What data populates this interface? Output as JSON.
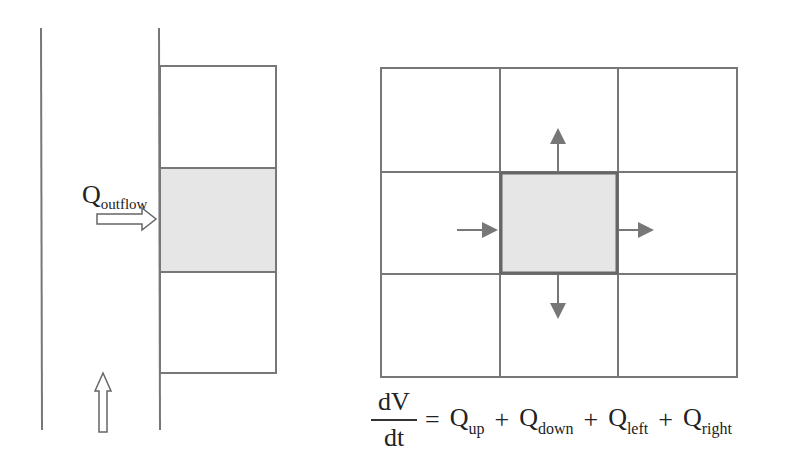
{
  "left_panel": {
    "inflow_label": {
      "main": "Q",
      "sub": "outflow"
    },
    "cells": [
      {
        "id": "top",
        "shaded": false
      },
      {
        "id": "middle",
        "shaded": true
      },
      {
        "id": "bottom",
        "shaded": false
      }
    ],
    "flow_direction_arrow": "up-arrow-icon"
  },
  "right_panel": {
    "grid": {
      "rows": 3,
      "cols": 3,
      "center_shaded": true
    },
    "arrows": [
      "up",
      "down",
      "left-in",
      "right-out"
    ]
  },
  "equation": {
    "numerator": "dV",
    "denominator": "dt",
    "equals": "=",
    "terms": [
      {
        "main": "Q",
        "sub": "up"
      },
      {
        "main": "Q",
        "sub": "down"
      },
      {
        "main": "Q",
        "sub": "left"
      },
      {
        "main": "Q",
        "sub": "right"
      }
    ],
    "plus": "+"
  },
  "colors": {
    "line": "#777777",
    "shade": "#e6e6e6",
    "center_border": "#666666",
    "arrow": "#777777"
  }
}
